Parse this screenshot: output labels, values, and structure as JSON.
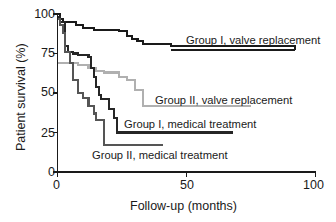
{
  "chart_data": {
    "type": "line",
    "title": "",
    "subtitle": "",
    "xlabel": "Follow-up (months)",
    "ylabel": "Patient survival (%)",
    "xlim": [
      0,
      100
    ],
    "ylim": [
      0,
      100
    ],
    "xticks": [
      0,
      50,
      100
    ],
    "xtick_labels": [
      "0",
      "50",
      "100"
    ],
    "yticks": [
      0,
      25,
      50,
      75,
      100
    ],
    "ytick_labels": [
      "0",
      "25",
      "50",
      "75",
      "100"
    ],
    "grid": false,
    "legend_position": "inline-annotations",
    "step_style": "post",
    "series": [
      {
        "name": "Group I, valve replacement",
        "color": "#1a1a1a",
        "line_width": 2.1,
        "label_leader_level": 77,
        "label_leader_x_start": 44,
        "label_leader_x_end": 92,
        "x": [
          0,
          1,
          2,
          4,
          7,
          10,
          14,
          20,
          24,
          27,
          29,
          31,
          33,
          44,
          92
        ],
        "y": [
          100,
          97,
          95,
          95,
          93,
          91,
          90,
          90,
          89,
          86,
          84,
          83,
          81,
          80,
          77
        ]
      },
      {
        "name": "Group II, valve replacement",
        "color": "#b0b0b0",
        "line_width": 2.1,
        "label_leader_level": 42,
        "label_leader_x_start": 33,
        "label_leader_x_end": 75,
        "x": [
          0,
          5,
          8,
          12,
          15,
          18,
          21,
          24,
          27,
          30,
          33,
          75
        ],
        "y": [
          69,
          69,
          68,
          66,
          64,
          63,
          63,
          60,
          58,
          52,
          42,
          42
        ]
      },
      {
        "name": "Group I, medical treatment",
        "color": "#262626",
        "line_width": 2.1,
        "label_leader_level": 25,
        "label_leader_x_start": 23,
        "label_leader_x_end": 68,
        "x": [
          0,
          1,
          3,
          4,
          6,
          8,
          10,
          12,
          13,
          14,
          15,
          16,
          17,
          18,
          20,
          22,
          23,
          68
        ],
        "y": [
          98,
          95,
          80,
          76,
          75,
          74,
          74,
          73,
          66,
          60,
          54,
          49,
          46,
          46,
          40,
          34,
          25,
          25
        ]
      },
      {
        "name": "Group II, medical treatment",
        "color": "#555555",
        "line_width": 2.1,
        "label_leader_level": 17,
        "label_leader_x_start": 18,
        "label_leader_x_end": 41,
        "x": [
          0,
          1,
          2,
          3,
          5,
          6,
          8,
          10,
          12,
          14,
          15,
          17,
          18,
          41
        ],
        "y": [
          97,
          93,
          88,
          76,
          69,
          58,
          50,
          47,
          42,
          37,
          33,
          33,
          17,
          17
        ]
      }
    ],
    "annotations": [
      {
        "text": "Group I, valve replacement",
        "series": 0
      },
      {
        "text": "Group II, valve replacement",
        "series": 1
      },
      {
        "text": "Group I, medical treatment",
        "series": 2
      },
      {
        "text": "Group II, medical treatment",
        "series": 3
      }
    ],
    "axis_color": "#1a1a1a"
  }
}
